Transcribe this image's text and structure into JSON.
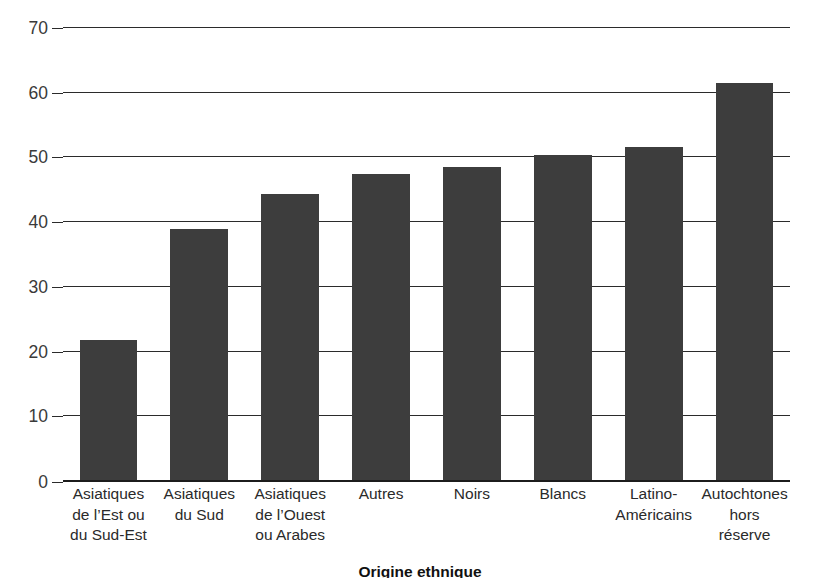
{
  "chart_data": {
    "type": "bar",
    "title": "",
    "subtitle": "",
    "xlabel": "Origine ethnique",
    "ylabel": "Pourcentage",
    "categories": [
      "Asiatiques\nde l’Est ou\ndu Sud-Est",
      "Asiatiques\ndu Sud",
      "Asiatiques\nde l’Ouest\nou Arabes",
      "Autres",
      "Noirs",
      "Blancs",
      "Latino-\nAméricains",
      "Autochtones\nhors\nréserve"
    ],
    "values": [
      21.7,
      38.8,
      44.2,
      47.3,
      48.3,
      50.3,
      51.5,
      61.3
    ],
    "ylim": [
      0,
      70
    ],
    "yticks": [
      0,
      10,
      20,
      30,
      40,
      50,
      60,
      70
    ],
    "ytick_labels": [
      "0",
      "10",
      "20",
      "30",
      "40",
      "50",
      "60",
      "70"
    ],
    "grid": true,
    "legend": "none",
    "bar_color": "#3d3d3d",
    "grid_color": "#2b2b2b",
    "axis_color": "#1c1c1c",
    "background": "#ffffff"
  }
}
